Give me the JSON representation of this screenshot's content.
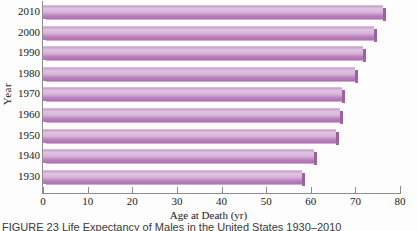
{
  "figure": {
    "caption": "FIGURE 23 Life Expectancy of Males in the United States 1930–2010"
  },
  "axes": {
    "xlabel": "Age at Death (yr)",
    "ylabel": "Year",
    "xticks": [
      "0",
      "10",
      "20",
      "30",
      "40",
      "50",
      "60",
      "70",
      "80"
    ],
    "yticks": [
      "2010",
      "2000",
      "1990",
      "1980",
      "1970",
      "1960",
      "1950",
      "1940",
      "1930"
    ]
  },
  "colors": {
    "bar_light": "#e0c4e2",
    "bar_mid": "#c9a0cb",
    "bar_dark": "#b277b6",
    "bar_edge": "#9c629f",
    "axis": "#8c8c8c",
    "background": "#fdfdfd"
  },
  "chart_data": {
    "type": "bar",
    "orientation": "horizontal",
    "xlabel": "Age at Death (yr)",
    "ylabel": "Year",
    "categories": [
      "2010",
      "2000",
      "1990",
      "1980",
      "1970",
      "1960",
      "1950",
      "1940",
      "1930"
    ],
    "values": [
      76.2,
      74.1,
      71.8,
      70.0,
      67.1,
      66.6,
      65.6,
      60.8,
      58.1
    ],
    "xlim": [
      0,
      80
    ],
    "xtick_step": 10,
    "grid": false,
    "legend": null,
    "series": [
      {
        "name": "Age at Death (yr)",
        "values": [
          76.2,
          74.1,
          71.8,
          70.0,
          67.1,
          66.6,
          65.6,
          60.8,
          58.1
        ]
      }
    ]
  }
}
